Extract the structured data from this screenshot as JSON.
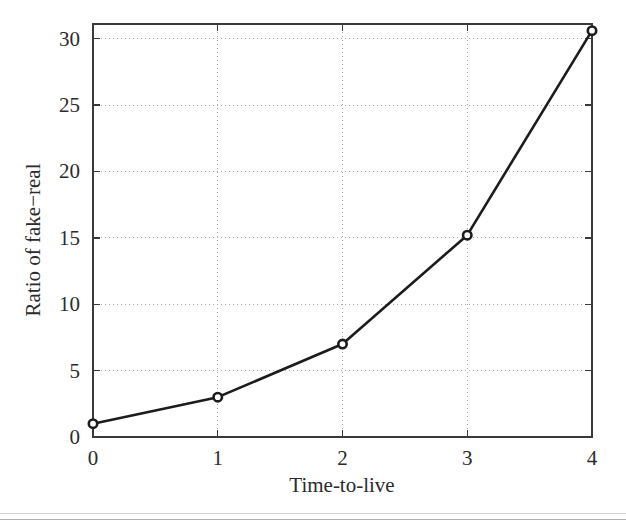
{
  "figure": {
    "background_color": "#ffffff",
    "ink_color": "#1c1c1c",
    "grid_color": "#a8a8a8"
  },
  "chart_data": {
    "type": "line",
    "title": "",
    "subtitle": "",
    "xlabel": "Time-to-live",
    "ylabel": "Ratio of fake−real",
    "x": [
      0,
      1,
      2,
      3,
      4
    ],
    "values": [
      1.0,
      3.0,
      7.0,
      15.2,
      30.6
    ],
    "series": [
      {
        "name": "Ratio of fake-real",
        "x": [
          0,
          1,
          2,
          3,
          4
        ],
        "values": [
          1.0,
          3.0,
          7.0,
          15.2,
          30.6
        ],
        "line_color": "#1c1c1c",
        "marker": "circle-open"
      }
    ],
    "xlim": [
      0,
      4
    ],
    "ylim": [
      0,
      31.1
    ],
    "xticks": [
      0,
      1,
      2,
      3,
      4
    ],
    "xtick_labels": [
      "0",
      "1",
      "2",
      "3",
      "4"
    ],
    "yticks": [
      0,
      5,
      10,
      15,
      20,
      25,
      30
    ],
    "ytick_labels": [
      "0",
      "5",
      "10",
      "15",
      "20",
      "25",
      "30"
    ],
    "grid": true,
    "grid_style": "dotted",
    "legend": false,
    "legend_position": "none",
    "annotations": []
  }
}
